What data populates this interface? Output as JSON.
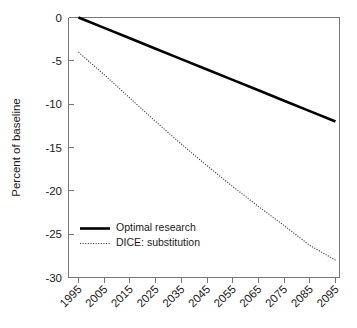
{
  "chart_data": {
    "type": "line",
    "title": "",
    "xlabel": "",
    "ylabel": "Percent of baseline",
    "xlim": [
      1995,
      2095
    ],
    "ylim": [
      -30,
      0
    ],
    "grid": false,
    "legend_position": "inside-lower-left",
    "categories": [
      1995,
      2005,
      2015,
      2025,
      2035,
      2045,
      2055,
      2065,
      2075,
      2085,
      2095
    ],
    "xticklabels": [
      "1995",
      "2005",
      "2015",
      "2025",
      "2035",
      "2045",
      "2055",
      "2065",
      "2075",
      "2085",
      "2095"
    ],
    "yticks": [
      0,
      -5,
      -10,
      -15,
      -20,
      -25,
      -30
    ],
    "yticklabels": [
      "0",
      "-5",
      "-10",
      "-15",
      "-20",
      "-25",
      "-30"
    ],
    "series": [
      {
        "name": "Optimal research",
        "style": "solid",
        "color": "#000000",
        "x": [
          1995,
          2005,
          2015,
          2025,
          2035,
          2045,
          2055,
          2065,
          2075,
          2085,
          2095
        ],
        "values": [
          0.0,
          -1.2,
          -2.4,
          -3.6,
          -4.8,
          -6.0,
          -7.2,
          -8.4,
          -9.6,
          -10.8,
          -12.0
        ]
      },
      {
        "name": "DICE: substitution",
        "style": "dotted",
        "color": "#3a3a3a",
        "x": [
          1995,
          2005,
          2015,
          2025,
          2035,
          2045,
          2055,
          2065,
          2075,
          2085,
          2095
        ],
        "values": [
          -4.0,
          -6.6,
          -9.3,
          -12.0,
          -14.6,
          -17.1,
          -19.5,
          -21.8,
          -24.0,
          -26.3,
          -28.0
        ]
      }
    ]
  },
  "axes": {
    "ylabel": "Percent of baseline"
  },
  "legend": {
    "items": [
      {
        "label": "Optimal research",
        "style": "solid"
      },
      {
        "label": "DICE: substitution",
        "style": "dotted"
      }
    ]
  }
}
